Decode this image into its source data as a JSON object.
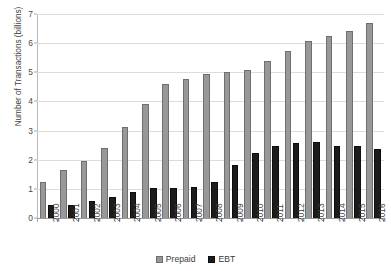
{
  "chart_data": {
    "type": "bar",
    "title": "",
    "xlabel": "",
    "ylabel": "Number of Transactions (billions)",
    "ylim": [
      0,
      7
    ],
    "yticks": [
      0,
      1,
      2,
      3,
      4,
      5,
      6,
      7
    ],
    "grid": true,
    "legend_position": "bottom",
    "categories": [
      "2000",
      "2001",
      "2002",
      "2003",
      "2004",
      "2005",
      "2006",
      "2007",
      "2008",
      "2009",
      "2010",
      "2011",
      "2012",
      "2013",
      "2014",
      "2015",
      "2016"
    ],
    "series": [
      {
        "name": "Prepaid",
        "color": "#989898",
        "values": [
          1.28,
          1.69,
          1.99,
          2.44,
          3.17,
          3.95,
          4.62,
          4.8,
          4.99,
          5.05,
          5.13,
          5.42,
          5.77,
          6.11,
          6.28,
          6.46,
          6.74
        ]
      },
      {
        "name": "EBT",
        "color": "#1c1c1c",
        "values": [
          0.47,
          0.49,
          0.61,
          0.77,
          0.94,
          1.05,
          1.07,
          1.11,
          1.27,
          1.85,
          2.28,
          2.5,
          2.62,
          2.64,
          2.49,
          2.49,
          2.39
        ]
      }
    ]
  },
  "legend": {
    "entries": [
      {
        "label": "Prepaid",
        "swatch": "prepaid-swatch"
      },
      {
        "label": "EBT",
        "swatch": "ebt-swatch"
      }
    ]
  }
}
